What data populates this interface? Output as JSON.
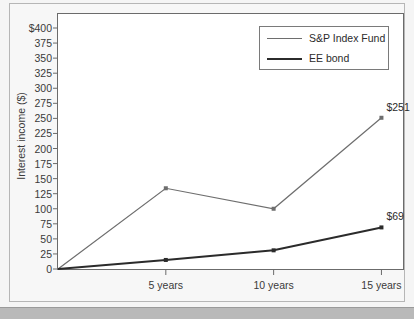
{
  "chart_data": {
    "type": "line",
    "title": "",
    "xlabel": "",
    "ylabel": "Interest income ($)",
    "categories": [
      "0",
      "5 years",
      "10 years",
      "15 years"
    ],
    "x_tick_labels": [
      "5 years",
      "10 years",
      "15 years"
    ],
    "y_tick_labels": [
      "$400",
      "375",
      "350",
      "325",
      "300",
      "275",
      "250",
      "225",
      "200",
      "175",
      "150",
      "125",
      "100",
      "75",
      "50",
      "25",
      "0"
    ],
    "y_tick_values": [
      400,
      375,
      350,
      325,
      300,
      275,
      250,
      225,
      200,
      175,
      150,
      125,
      100,
      75,
      50,
      25,
      0
    ],
    "ylim": [
      0,
      400
    ],
    "grid": false,
    "legend_position": "top-right",
    "series": [
      {
        "name": "S&P Index Fund",
        "color": "#6e6e6e",
        "width": 1.2,
        "x": [
          0,
          5,
          10,
          15
        ],
        "values": [
          0,
          134,
          100,
          251
        ],
        "point_labels": [
          "",
          "",
          "",
          "$251"
        ]
      },
      {
        "name": "EE bond",
        "color": "#2b2b2b",
        "width": 2.0,
        "x": [
          0,
          5,
          10,
          15
        ],
        "values": [
          0,
          15,
          31,
          69
        ],
        "point_labels": [
          "",
          "",
          "",
          "$69"
        ]
      }
    ],
    "annotations": [
      {
        "text": "$251",
        "series": "S&P Index Fund",
        "x": 15,
        "y": 251
      },
      {
        "text": "$69",
        "series": "EE bond",
        "x": 15,
        "y": 69
      }
    ]
  },
  "legend": {
    "items": [
      {
        "label": "S&P Index Fund"
      },
      {
        "label": "EE bond"
      }
    ]
  },
  "colors": {
    "background": "#f5f5f5",
    "plot_background": "#ffffff",
    "axis": "#6b6b6b",
    "sp_line": "#6e6e6e",
    "ee_line": "#2b2b2b",
    "text": "#3a3a3a"
  }
}
